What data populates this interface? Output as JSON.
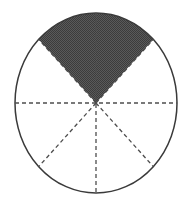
{
  "diagram": {
    "type": "fraction-circle",
    "total_parts": 8,
    "shaded_parts": 2,
    "fraction_shaded": "2/8",
    "shaded_region": "top quarter (sectors between 45° and 135°)",
    "colors": {
      "shade": "#4a4a4a",
      "outline": "#3a3a3a",
      "divider": "#555555",
      "background": "#ffffff"
    },
    "geometry": {
      "cx": 96,
      "cy": 103,
      "rx": 81,
      "ry": 90
    }
  }
}
